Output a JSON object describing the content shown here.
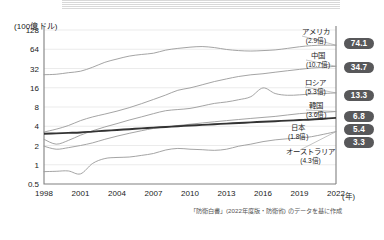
{
  "unit_label": "(100億ドル)",
  "x_unit_label": "(年)",
  "footnote": "「防衛白書」(2022年度版・防衛省) のデータを基に作成",
  "axis": {
    "y_ticks": [
      "128",
      "64",
      "32",
      "16",
      "8",
      "4",
      "2",
      "1",
      "0.5"
    ],
    "x_ticks": [
      "1998",
      "2001",
      "2004",
      "2007",
      "2010",
      "2013",
      "2016",
      "2019",
      "2022"
    ]
  },
  "labels": [
    {
      "name": "アメリカ",
      "sub": "(2.9倍)"
    },
    {
      "name": "中国",
      "sub": "(10.7倍)"
    },
    {
      "name": "ロシア",
      "sub": "(5.3倍)"
    },
    {
      "name": "韓国",
      "sub": "(3.6倍)"
    },
    {
      "name": "日本",
      "sub": "(1.8倍)"
    },
    {
      "name": "オーストラリア",
      "sub": "(4.3倍)"
    }
  ],
  "badges": [
    "74.1",
    "34.7",
    "13.3",
    "6.8",
    "5.4",
    "3.3"
  ],
  "chart_data": {
    "type": "line",
    "title": "",
    "xlabel": "(年)",
    "ylabel": "(100億ドル)",
    "yscale": "log",
    "ylim": [
      0.5,
      128
    ],
    "xlim": [
      1998,
      2022
    ],
    "grid": true,
    "legend": "right-callouts",
    "y_tick_values": [
      128,
      64,
      32,
      16,
      8,
      4,
      2,
      1,
      0.5
    ],
    "x": [
      1998,
      1999,
      2000,
      2001,
      2002,
      2003,
      2004,
      2005,
      2006,
      2007,
      2008,
      2009,
      2010,
      2011,
      2012,
      2013,
      2014,
      2015,
      2016,
      2017,
      2018,
      2019,
      2020,
      2021,
      2022
    ],
    "series": [
      {
        "name": "アメリカ",
        "multiplier": "2.9倍",
        "end_value": 74.1,
        "color": "#9a9a9a",
        "values": [
          25.6,
          26.0,
          27.5,
          29.0,
          33.5,
          40.0,
          45.0,
          50.0,
          53.0,
          55.5,
          62.0,
          66.0,
          69.0,
          70.5,
          68.0,
          63.5,
          61.0,
          60.0,
          61.0,
          62.5,
          66.0,
          70.0,
          73.0,
          74.0,
          74.1
        ]
      },
      {
        "name": "中国",
        "multiplier": "10.7倍",
        "end_value": 34.7,
        "color": "#9a9a9a",
        "values": [
          3.25,
          3.6,
          4.1,
          4.9,
          5.6,
          6.2,
          6.9,
          7.8,
          9.0,
          10.5,
          12.3,
          14.6,
          15.9,
          17.8,
          20.0,
          22.0,
          24.0,
          25.5,
          26.5,
          28.0,
          29.5,
          31.0,
          32.5,
          33.5,
          34.7
        ]
      },
      {
        "name": "ロシア",
        "multiplier": "5.3倍",
        "end_value": 13.3,
        "color": "#9a9a9a",
        "values": [
          2.5,
          2.1,
          2.4,
          2.9,
          3.4,
          3.9,
          4.4,
          5.0,
          5.6,
          6.3,
          7.0,
          7.3,
          7.6,
          8.3,
          9.1,
          9.6,
          10.4,
          11.6,
          15.9,
          13.0,
          12.2,
          12.4,
          12.8,
          13.0,
          13.3
        ]
      },
      {
        "name": "韓国",
        "multiplier": "3.6倍",
        "end_value": 6.8,
        "color": "#9a9a9a",
        "values": [
          1.95,
          1.75,
          1.85,
          2.0,
          2.2,
          2.5,
          2.8,
          3.1,
          3.4,
          3.7,
          3.9,
          4.1,
          4.3,
          4.5,
          4.7,
          4.9,
          5.1,
          5.3,
          5.5,
          5.7,
          6.0,
          6.3,
          6.5,
          6.6,
          6.8
        ]
      },
      {
        "name": "日本",
        "multiplier": "1.8倍",
        "end_value": 5.4,
        "color": "#333333",
        "emphasis": true,
        "values": [
          3.05,
          3.1,
          3.15,
          3.2,
          3.3,
          3.4,
          3.5,
          3.6,
          3.7,
          3.8,
          3.9,
          4.0,
          4.1,
          4.2,
          4.3,
          4.4,
          4.5,
          4.6,
          4.7,
          4.8,
          4.9,
          5.0,
          5.1,
          5.25,
          5.4
        ]
      },
      {
        "name": "オーストラリア",
        "multiplier": "4.3倍",
        "end_value": 3.3,
        "color": "#9a9a9a",
        "values": [
          0.78,
          0.79,
          0.8,
          0.72,
          1.05,
          1.25,
          1.3,
          1.32,
          1.4,
          1.5,
          1.7,
          1.8,
          1.75,
          1.72,
          1.68,
          1.75,
          1.95,
          2.1,
          2.3,
          2.45,
          2.55,
          2.6,
          2.75,
          3.0,
          3.3
        ]
      }
    ]
  }
}
